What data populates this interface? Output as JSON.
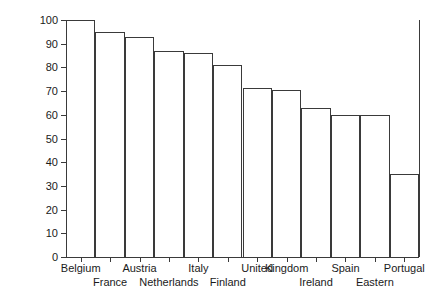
{
  "chart_data": {
    "type": "bar",
    "title": "",
    "subtitle": "",
    "xlabel": "",
    "ylabel": "",
    "categories": [
      "Belgium",
      "France",
      "Austria",
      "Netherlands",
      "Italy",
      "United",
      "Kingdom",
      "Ireland",
      "Spain",
      "Eastern",
      "Germany",
      "Portugal"
    ],
    "values": [
      100,
      95,
      93,
      87,
      86,
      81,
      71.5,
      70.5,
      63,
      60,
      60,
      35
    ],
    "ylim": [
      0,
      100
    ],
    "yticks": [
      0,
      10,
      20,
      30,
      40,
      50,
      60,
      70,
      80,
      90,
      100
    ],
    "ytick_labels": [
      "0",
      "10",
      "20",
      "30",
      "40",
      "50",
      "60",
      "70",
      "80",
      "90",
      "100"
    ],
    "grid": false,
    "legend": null,
    "bar_style": "outline",
    "bar_edge_color": "#3a3a3a",
    "bar_fill_color": "transparent",
    "label_layout": "staggered-two-rows",
    "label_rows": {
      "top": [
        "Belgium",
        "Austria",
        "Italy",
        "United",
        "Kingdom",
        "Spain",
        "Portugal"
      ],
      "bottom": [
        "France",
        "Netherlands",
        "Finland",
        "Ireland",
        "Eastern",
        "Germany"
      ]
    },
    "bars": [
      {
        "index": 0,
        "label": "Belgium",
        "label_row": "top",
        "value": 100
      },
      {
        "index": 1,
        "label": "France",
        "label_row": "bottom",
        "value": 95
      },
      {
        "index": 2,
        "label": "Austria",
        "label_row": "top",
        "value": 93
      },
      {
        "index": 3,
        "label": "Netherlands",
        "label_row": "bottom",
        "value": 87
      },
      {
        "index": 4,
        "label": "Italy",
        "label_row": "top",
        "value": 86
      },
      {
        "index": 5,
        "label": "Finland",
        "label_row": "bottom",
        "value": 81
      },
      {
        "index": 6,
        "label": "United",
        "label_row": "top",
        "value": 71.5
      },
      {
        "index": 7,
        "label": "Kingdom",
        "label_row": "top",
        "value": 70.5
      },
      {
        "index": 8,
        "label": "Ireland",
        "label_row": "bottom",
        "value": 63
      },
      {
        "index": 9,
        "label": "Spain",
        "label_row": "top",
        "value": 60
      },
      {
        "index": 10,
        "label": "Eastern",
        "label_row": "bottom",
        "value": 60
      },
      {
        "index": 11,
        "label": "Portugal",
        "label_row": "top",
        "value": 35
      }
    ]
  },
  "axis": {
    "y_min": 0,
    "y_max": 100,
    "y_step": 10
  },
  "colors": {
    "line": "#3a3a3a",
    "text": "#1a1a1a",
    "background": "#ffffff"
  }
}
